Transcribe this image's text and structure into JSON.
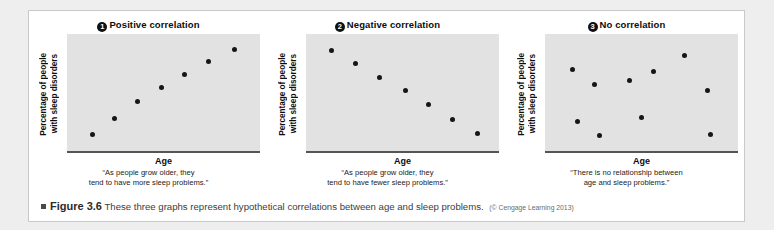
{
  "figure": {
    "bullet_icon": "square-bullet-icon",
    "number_label": "Figure 3.6",
    "caption_text": "These three graphs represent hypothetical correlations between age and sleep problems.",
    "credit": "(© Cengage Learning 2013)"
  },
  "colors": {
    "page_background": "#eeeeee",
    "card_background": "#ffffff",
    "card_border": "#c9c9c9",
    "plot_background": "#e2e2e2",
    "dot_color": "#161616",
    "axis_color": "#555555",
    "badge_background": "#111111",
    "badge_text": "#ffffff"
  },
  "panels": [
    {
      "badge": "1",
      "title": "Positive correlation",
      "xlabel": "Age",
      "ylabel_line1": "Percentage of people",
      "ylabel_line2": "with sleep disorders",
      "quote_line1": "“As people grow older, they",
      "quote_line2": "tend to have more sleep problems.”"
    },
    {
      "badge": "2",
      "title": "Negative correlation",
      "xlabel": "Age",
      "ylabel_line1": "Percentage of people",
      "ylabel_line2": "with sleep disorders",
      "quote_line1": "“As people grow older, they",
      "quote_line2": "tend to have fewer sleep problems.”"
    },
    {
      "badge": "3",
      "title": "No correlation",
      "xlabel": "Age",
      "ylabel_line1": "Percentage of people",
      "ylabel_line2": "with sleep disorders",
      "quote_line1": "“There is no relationship between",
      "quote_line2": "age and sleep problems.”"
    }
  ],
  "chart_data": [
    {
      "type": "scatter",
      "title": "① Positive correlation",
      "xlabel": "Age",
      "ylabel": "Percentage of people with sleep disorders",
      "xlim": [
        0,
        100
      ],
      "ylim": [
        0,
        100
      ],
      "grid": false,
      "legend": "none",
      "annotation": "“As people grow older, they tend to have more sleep problems.”",
      "points": [
        {
          "x": 9,
          "y": 9
        },
        {
          "x": 22,
          "y": 25
        },
        {
          "x": 35,
          "y": 41
        },
        {
          "x": 49,
          "y": 55
        },
        {
          "x": 62,
          "y": 67
        },
        {
          "x": 76,
          "y": 80
        },
        {
          "x": 91,
          "y": 92
        }
      ]
    },
    {
      "type": "scatter",
      "title": "② Negative correlation",
      "xlabel": "Age",
      "ylabel": "Percentage of people with sleep disorders",
      "xlim": [
        0,
        100
      ],
      "ylim": [
        0,
        100
      ],
      "grid": false,
      "legend": "none",
      "annotation": "“As people grow older, they tend to have fewer sleep problems.”",
      "points": [
        {
          "x": 9,
          "y": 91
        },
        {
          "x": 23,
          "y": 78
        },
        {
          "x": 37,
          "y": 65
        },
        {
          "x": 52,
          "y": 52
        },
        {
          "x": 65,
          "y": 38
        },
        {
          "x": 79,
          "y": 24
        },
        {
          "x": 93,
          "y": 10
        }
      ]
    },
    {
      "type": "scatter",
      "title": "③ No correlation",
      "xlabel": "Age",
      "ylabel": "Percentage of people with sleep disorders",
      "xlim": [
        0,
        100
      ],
      "ylim": [
        0,
        100
      ],
      "grid": false,
      "legend": "none",
      "annotation": "“There is no relationship between age and sleep problems.”",
      "points": [
        {
          "x": 10,
          "y": 72
        },
        {
          "x": 23,
          "y": 58
        },
        {
          "x": 43,
          "y": 62
        },
        {
          "x": 57,
          "y": 70
        },
        {
          "x": 75,
          "y": 86
        },
        {
          "x": 88,
          "y": 52
        },
        {
          "x": 13,
          "y": 22
        },
        {
          "x": 26,
          "y": 8
        },
        {
          "x": 50,
          "y": 26
        },
        {
          "x": 90,
          "y": 9
        }
      ]
    }
  ]
}
